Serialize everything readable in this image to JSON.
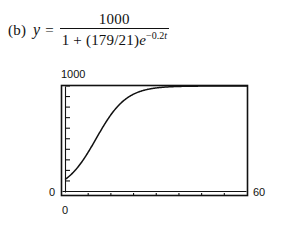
{
  "equation": {
    "part_label": "(b)",
    "variable": "y",
    "equals": "=",
    "numerator": "1000",
    "denominator_prefix": "1 + (179/21)",
    "denominator_base": "e",
    "exponent_sign": "−",
    "exponent_coefficient": "0.2",
    "exponent_variable": "t"
  },
  "chart_data": {
    "type": "line",
    "title": "",
    "xlabel": "",
    "ylabel": "",
    "xlim": [
      0,
      60
    ],
    "ylim": [
      0,
      1000
    ],
    "grid": false,
    "legend": false,
    "y_axis_top_label": "1000",
    "y_axis_bottom_label": "0",
    "x_axis_left_label": "0",
    "x_axis_right_label": "60",
    "y_tick_count": 10,
    "x_tick_count": 7,
    "curve_color": "#111111",
    "frame_color": "#111111",
    "equation_form": "y = 1000 / (1 + (179/21)e^(-0.2t))",
    "carrying_capacity": 1000,
    "initial_value": 117,
    "growth_rate": 0.2,
    "series": [
      {
        "name": "logistic",
        "x": [
          0,
          2,
          4,
          6,
          8,
          10,
          12,
          14,
          16,
          18,
          20,
          22,
          24,
          26,
          28,
          30,
          32,
          34,
          36,
          38,
          40,
          44,
          48,
          52,
          56,
          60
        ],
        "y": [
          117,
          163,
          222,
          294,
          377,
          467,
          557,
          643,
          719,
          783,
          834,
          874,
          904,
          928,
          945,
          958,
          968,
          976,
          981,
          986,
          989,
          993,
          995,
          997,
          998,
          999
        ]
      }
    ]
  }
}
